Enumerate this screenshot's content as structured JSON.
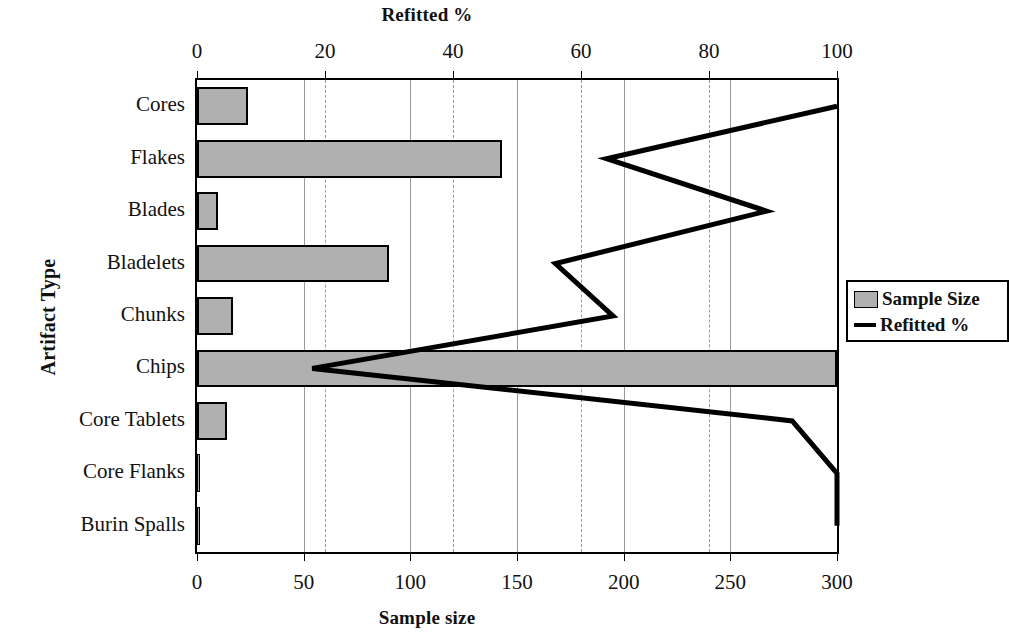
{
  "chart_data": {
    "type": "bar",
    "title": "",
    "orientation": "horizontal",
    "categories": [
      "Cores",
      "Flakes",
      "Blades",
      "Bladelets",
      "Chunks",
      "Chips",
      "Core Tablets",
      "Core Flanks",
      "Burin Spalls"
    ],
    "ylabel": "Artifact Type",
    "xlabel": "Sample size",
    "top_axis_label": "Refitted %",
    "bottom_axis_label": "Sample size",
    "xlim": [
      0,
      300
    ],
    "top_xlim": [
      0,
      100
    ],
    "bottom_ticks": [
      "0",
      "50",
      "100",
      "150",
      "200",
      "250",
      "300"
    ],
    "bottom_tick_values": [
      0,
      50,
      100,
      150,
      200,
      250,
      300
    ],
    "top_ticks": [
      "0",
      "20",
      "40",
      "60",
      "80",
      "100"
    ],
    "top_tick_values": [
      0,
      20,
      40,
      60,
      80,
      100
    ],
    "grid": true,
    "legend_position": "right",
    "series": [
      {
        "name": "Sample Size",
        "kind": "bar",
        "axis": "bottom",
        "color": "#b0b0b0",
        "values": [
          24,
          143,
          10,
          90,
          17,
          300,
          14,
          1,
          1
        ]
      },
      {
        "name": "Refitted %",
        "kind": "line",
        "axis": "top",
        "color": "#000000",
        "values": [
          100,
          64,
          89,
          56,
          65,
          18,
          93,
          100,
          100
        ]
      }
    ]
  },
  "legend": {
    "items": [
      {
        "label": "Sample Size",
        "marker": "swatch"
      },
      {
        "label": "Refitted %",
        "marker": "line"
      }
    ]
  }
}
